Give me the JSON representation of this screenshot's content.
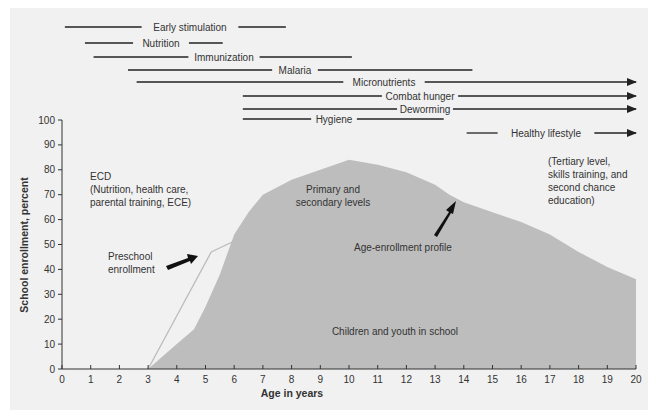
{
  "chart_data": {
    "type": "area",
    "title": "",
    "xlabel": "Age in years",
    "ylabel": "School enrollment, percent",
    "xlim": [
      0,
      20
    ],
    "ylim": [
      0,
      100
    ],
    "x_ticks": [
      0,
      1,
      2,
      3,
      4,
      5,
      6,
      7,
      8,
      9,
      10,
      11,
      12,
      13,
      14,
      15,
      16,
      17,
      18,
      19,
      20
    ],
    "y_ticks": [
      0,
      10,
      20,
      30,
      40,
      50,
      60,
      70,
      80,
      90,
      100
    ],
    "grid": false,
    "series": [
      {
        "name": "Age-enrollment profile",
        "style": "filled-area",
        "color": "#bdbdbd",
        "x": [
          3,
          4,
          4.6,
          5,
          5.5,
          6,
          6.5,
          7,
          8,
          9,
          10,
          11,
          12,
          13,
          13.5,
          14,
          15,
          16,
          17,
          18,
          19,
          20
        ],
        "values": [
          0,
          10,
          16,
          25,
          38,
          54,
          63,
          70,
          76,
          80,
          84,
          82,
          79,
          74,
          70,
          67,
          63,
          59,
          54,
          47,
          41,
          36
        ]
      },
      {
        "name": "Preschool enrollment",
        "style": "thin-line",
        "color": "#bcbcbc",
        "x": [
          3,
          5.2,
          6.3
        ],
        "values": [
          0,
          47,
          53
        ]
      }
    ],
    "interventions": [
      {
        "label": "Early stimulation",
        "start": 0.1,
        "end": 7.8,
        "arrow": false
      },
      {
        "label": "Nutrition",
        "start": 0.8,
        "end": 5.6,
        "arrow": false
      },
      {
        "label": "Immunization",
        "start": 1.1,
        "end": 10.1,
        "arrow": false
      },
      {
        "label": "Malaria",
        "start": 2.3,
        "end": 14.3,
        "arrow": false
      },
      {
        "label": "Micronutrients",
        "start": 2.6,
        "end": 20,
        "arrow": true
      },
      {
        "label": "Combat hunger",
        "start": 6.3,
        "end": 20,
        "arrow": true
      },
      {
        "label": "Deworming",
        "start": 6.3,
        "end": 20,
        "arrow": true
      },
      {
        "label": "Hygiene",
        "start": 6.3,
        "end": 13.3,
        "arrow": false
      },
      {
        "label": "Healthy lifestyle",
        "start": 14.1,
        "end": 20,
        "arrow": true
      }
    ],
    "annotations": [
      {
        "text": [
          "ECD",
          "(Nutrition, health care,",
          "parental training, ECE)"
        ]
      },
      {
        "text": [
          "Primary and",
          "secondary levels"
        ]
      },
      {
        "text": [
          "(Tertiary level,",
          "skills training, and",
          "second chance",
          "education)"
        ]
      },
      {
        "text": [
          "Preschool",
          "enrollment"
        ],
        "arrow": true
      },
      {
        "text": [
          "Age-enrollment profile"
        ],
        "arrow": true
      },
      {
        "text": [
          "Children and youth in school"
        ]
      }
    ]
  },
  "labels": {
    "xlabel": "Age in years",
    "ylabel": "School enrollment, percent",
    "ecd_1": "ECD",
    "ecd_2": "(Nutrition, health care,",
    "ecd_3": "parental training, ECE)",
    "prim_1": "Primary and",
    "prim_2": "secondary levels",
    "tert_1": "(Tertiary level,",
    "tert_2": "skills training, and",
    "tert_3": "second chance",
    "tert_4": "education)",
    "pre_1": "Preschool",
    "pre_2": "enrollment",
    "profile": "Age-enrollment profile",
    "inschool": "Children and youth in school"
  },
  "colors": {
    "panel_bg": "#f1f1f1",
    "area_fill": "#bdbdbd",
    "preschool_line": "#bcbcbc",
    "ink": "#222222"
  }
}
